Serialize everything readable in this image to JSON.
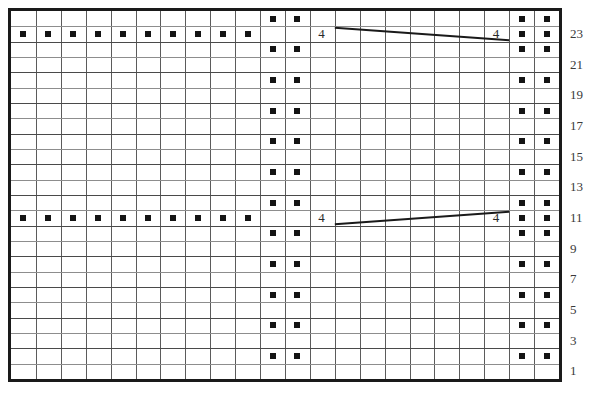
{
  "chart_data": {
    "type": "table",
    "title": "",
    "subtitle": "",
    "xlabel": "",
    "ylabel": "",
    "grid": {
      "columns": 22,
      "rows": 24,
      "grid_visible": true,
      "border_color": "#1a1a1a",
      "gridline_color": "#5b5b5b",
      "background": "#ffffff"
    },
    "row_number_labels": [
      "23",
      "21",
      "19",
      "17",
      "15",
      "13",
      "11",
      "9",
      "7",
      "5",
      "3",
      "1"
    ],
    "row_numbers_side": "right",
    "row_numbers_rows": [
      23,
      21,
      19,
      17,
      15,
      13,
      11,
      9,
      7,
      5,
      3,
      1
    ],
    "symbol_legend": {
      "filled_square": "purl stitch",
      "number_4": "4-stitch cable cross"
    },
    "symbol_color": "#141414",
    "dot_columns_even_rows": [
      11,
      12,
      21,
      22
    ],
    "dot_rows_even": [
      24,
      22,
      20,
      18,
      16,
      14,
      12,
      10,
      8,
      6,
      4,
      2
    ],
    "dot_rows_special": [
      23,
      11
    ],
    "dot_columns_special_left": [
      1,
      2,
      3,
      4,
      5,
      6,
      7,
      8,
      9,
      10
    ],
    "dot_columns_special_right": [
      21,
      22
    ],
    "cable_markers": [
      {
        "row": 23,
        "label_left": "4",
        "label_right": "4",
        "direction": "down-right"
      },
      {
        "row": 11,
        "label_left": "4",
        "label_right": "4",
        "direction": "up-right"
      }
    ],
    "cable_label": "4",
    "line_color": "#1a1a1a"
  },
  "chart": {
    "left_number_label": "4",
    "right_number_label": "4"
  }
}
